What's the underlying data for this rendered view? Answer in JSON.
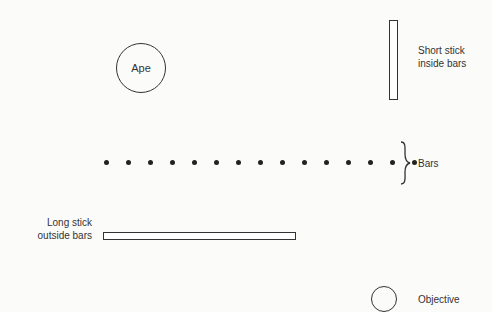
{
  "diagram": {
    "ape": {
      "label": "Ape"
    },
    "short_stick": {
      "label_line1": "Short stick",
      "label_line2": "inside bars"
    },
    "bars": {
      "label": "Bars",
      "dot_count": 15,
      "dot_x": [
        104,
        126,
        148,
        170,
        192,
        214,
        236,
        258,
        280,
        302,
        324,
        346,
        368,
        390,
        412
      ]
    },
    "long_stick": {
      "label_line1": "Long stick",
      "label_line2": "outside bars"
    },
    "objective": {
      "label": "Objective"
    }
  }
}
